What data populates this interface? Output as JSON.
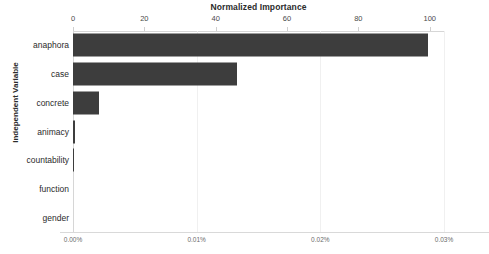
{
  "chart_data": {
    "type": "bar",
    "orientation": "horizontal",
    "title": "Normalized Importance",
    "xlabel": "Normalized Importance",
    "ylabel": "Independent Variable",
    "categories": [
      "anaphora",
      "case",
      "concrete",
      "animacy",
      "countability",
      "function",
      "gender"
    ],
    "values": [
      99.5,
      46.0,
      7.3,
      0.5,
      0.2,
      0.0,
      0.0
    ],
    "series": [
      {
        "name": "Normalized Importance",
        "values": [
          99.5,
          46.0,
          7.3,
          0.5,
          0.2,
          0.0,
          0.0
        ]
      }
    ],
    "xlim": [
      0,
      104
    ],
    "top_axis": {
      "label": "Normalized Importance",
      "ticks": [
        0,
        20,
        40,
        60,
        80,
        100
      ],
      "tick_labels": [
        "0",
        "20",
        "40",
        "60",
        "80",
        "100"
      ]
    },
    "bottom_axis": {
      "label": "",
      "ticks": [
        0,
        0.01,
        0.02,
        0.03
      ],
      "tick_labels": [
        "0.00%",
        "0.01%",
        "0.02%",
        "0.03%"
      ],
      "units": "percent"
    },
    "grid": false,
    "legend": null,
    "bar_color": "#3d3d3d",
    "background_color": "#ffffff",
    "axis_color": "#d6d6d6",
    "text_color": "#2b2b2b"
  }
}
